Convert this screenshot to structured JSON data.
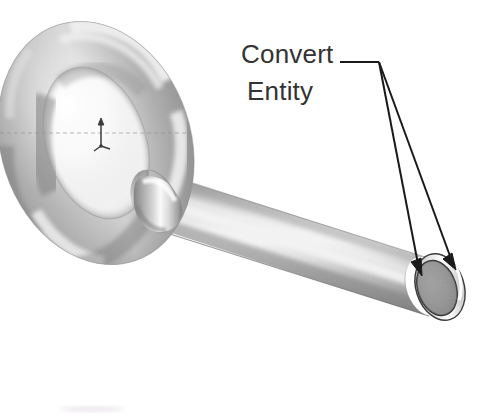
{
  "canvas": {
    "width": 478,
    "height": 417,
    "background_color": "#ffffff"
  },
  "annotation": {
    "label_line_1": "Convert",
    "label_line_2": "Entity",
    "text_color": "#333333",
    "leader_color": "#1a1a1a",
    "leader_elbow": {
      "x": 378,
      "y": 62
    },
    "leader_shoulder": {
      "x": 340,
      "y": 62
    },
    "arrow_1_tip": {
      "x": 423,
      "y": 272
    },
    "arrow_2_tip": {
      "x": 455,
      "y": 265
    }
  },
  "model": {
    "name": "eye-bolt",
    "description": "Shaded 3D CAD model of an eye bolt: toroidal ring joined to a cylindrical shaft",
    "material_shading": "polished metal grayscale",
    "highlight_color": "#ffffff",
    "mid_tone_color": "#b9b9b9",
    "shadow_color": "#6e6e6e",
    "outline_color": "#4a4a4a",
    "torus": {
      "center": {
        "x": 96,
        "y": 143
      },
      "outer_rx": 96,
      "outer_ry": 125,
      "tube_thickness": 44,
      "rotation_deg": -18
    },
    "shaft": {
      "start": {
        "x": 150,
        "y": 196
      },
      "end": {
        "x": 440,
        "y": 286
      },
      "diameter": 58,
      "tilt_deg": 18
    },
    "end_face": {
      "center": {
        "x": 439,
        "y": 287
      },
      "rx": 20,
      "ry": 30,
      "fill_color": "#8d8d8d",
      "rim_color": "#ffffff",
      "outline_color": "#2b2b2b",
      "texture": "speckled"
    },
    "parting_line": {
      "style": "dashed",
      "y": 133,
      "color": "#9a9a9a"
    }
  },
  "origin_marker": {
    "name": "coordinate-origin-triad",
    "position": {
      "x": 101,
      "y": 132
    },
    "color": "#3b3b3b",
    "axes": [
      "y-up-arrow",
      "x-right-tick",
      "z-down-left-tick"
    ]
  },
  "artifacts": {
    "bottom_smudge": {
      "x": 62,
      "y": 407,
      "width": 60,
      "height": 5,
      "color": "#efecef"
    }
  }
}
